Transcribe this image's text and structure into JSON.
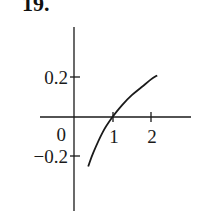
{
  "problem_number": "19.",
  "chart_data": {
    "type": "line",
    "title": "",
    "xlabel": "",
    "ylabel": "",
    "x_ticks": [
      1,
      2
    ],
    "x_tick_labels": [
      "1",
      "2"
    ],
    "y_ticks": [
      0.2,
      -0.2
    ],
    "y_tick_labels": [
      "0.2",
      "−0.2"
    ],
    "origin_label": "0",
    "xlim": [
      -0.9,
      3.0
    ],
    "ylim": [
      -0.47,
      0.45
    ],
    "grid": false,
    "legend": null,
    "series": [
      {
        "name": "curve",
        "description": "increasing concave-down curve crossing x-axis at x=1 (log-like)",
        "x": [
          0.37,
          0.5,
          0.75,
          1.0,
          1.25,
          1.5,
          1.75,
          2.0,
          2.16
        ],
        "y": [
          -0.25,
          -0.18,
          -0.075,
          0.0,
          0.06,
          0.11,
          0.15,
          0.19,
          0.21
        ]
      }
    ]
  }
}
